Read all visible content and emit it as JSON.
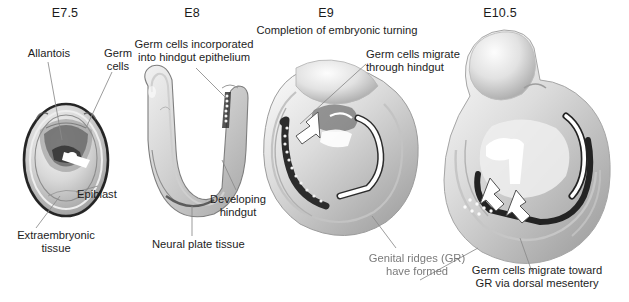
{
  "figure": {
    "background_color": "#ffffff",
    "text_color": "#1d1d1d",
    "embryo_color": "#c9c9c9"
  },
  "stages": [
    {
      "id": "e7.5",
      "label": "E7.5"
    },
    {
      "id": "e8",
      "label": "E8"
    },
    {
      "id": "e9",
      "label": "E9"
    },
    {
      "id": "e10.5",
      "label": "E10.5"
    }
  ],
  "annotations": {
    "allantois": "Allantois",
    "germ_cells_e75": "Germ\ncells",
    "epiblast": "Epiblast",
    "extraembryonic": "Extraembryonic\ntissue",
    "germ_cells_incorporated": "Germ cells incorporated\ninto hindgut epithelium",
    "developing_hindgut": "Developing\nhindgut",
    "neural_plate": "Neural plate tissue",
    "turning": "Completion of embryonic turning",
    "germ_cells_migrate_hindgut": "Germ cells migrate\nthrough hindgut",
    "genital_ridges": "Genital ridges (GR)\nhave formed",
    "germ_cells_migrate_gr": "Germ cells migrate toward\nGR via dorsal mesentery"
  }
}
